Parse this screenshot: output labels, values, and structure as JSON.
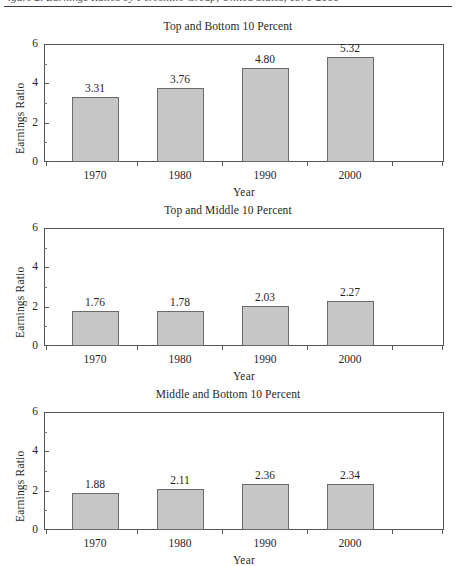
{
  "page": {
    "header_text": "igure 2. Earnings Ratios by Percentile Group, United States, 1970-2000",
    "header_rule": true
  },
  "axis": {
    "ylabel": "Earnings Ratio",
    "xlabel": "Year",
    "yticks": [
      "0",
      "2",
      "4",
      "6"
    ],
    "ylim": [
      0,
      6
    ],
    "xticks": [
      "1970",
      "1980",
      "1990",
      "2000"
    ]
  },
  "chart_data": [
    {
      "type": "bar",
      "title": "Top and Bottom 10 Percent",
      "categories": [
        "1970",
        "1980",
        "1990",
        "2000"
      ],
      "values": [
        3.31,
        3.76,
        4.8,
        5.32
      ],
      "labels": [
        "3.31",
        "3.76",
        "4.80",
        "5.32"
      ],
      "xlabel": "Year",
      "ylabel": "Earnings Ratio",
      "ylim": [
        0,
        6
      ],
      "yticks": [
        0,
        2,
        4,
        6
      ],
      "grid": false,
      "legend": "none",
      "bar_color": "#c6c6c6",
      "bar_edge_color": "#6b6b6b"
    },
    {
      "type": "bar",
      "title": "Top and Middle 10 Percent",
      "categories": [
        "1970",
        "1980",
        "1990",
        "2000"
      ],
      "values": [
        1.76,
        1.78,
        2.03,
        2.27
      ],
      "labels": [
        "1.76",
        "1.78",
        "2.03",
        "2.27"
      ],
      "xlabel": "Year",
      "ylabel": "Earnings Ratio",
      "ylim": [
        0,
        6
      ],
      "yticks": [
        0,
        2,
        4,
        6
      ],
      "grid": false,
      "legend": "none",
      "bar_color": "#c6c6c6",
      "bar_edge_color": "#6b6b6b"
    },
    {
      "type": "bar",
      "title": "Middle and Bottom 10 Percent",
      "categories": [
        "1970",
        "1980",
        "1990",
        "2000"
      ],
      "values": [
        1.88,
        2.11,
        2.36,
        2.34
      ],
      "labels": [
        "1.88",
        "2.11",
        "2.36",
        "2.34"
      ],
      "xlabel": "Year",
      "ylabel": "Earnings Ratio",
      "ylim": [
        0,
        6
      ],
      "yticks": [
        0,
        2,
        4,
        6
      ],
      "grid": false,
      "legend": "none",
      "bar_color": "#c6c6c6",
      "bar_edge_color": "#6b6b6b"
    }
  ]
}
